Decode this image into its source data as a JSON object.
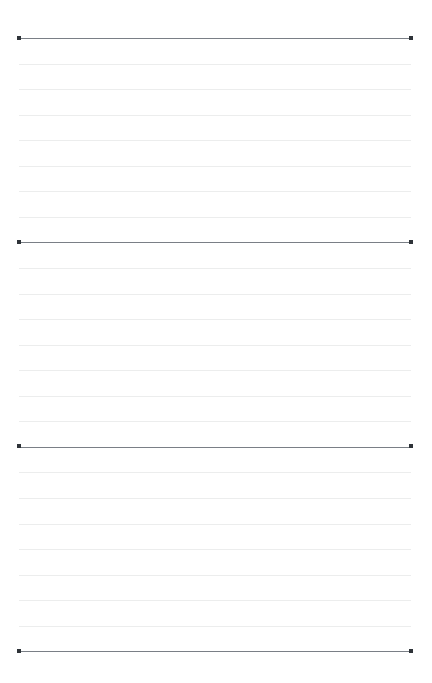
{
  "document": {
    "kind": "ruled-writing-guide-sheet",
    "title": "Lined paper ruling guide",
    "page": {
      "width": 432,
      "height": 683,
      "background_color": "#ffffff"
    },
    "ruling": {
      "left_x": 19,
      "right_x": 411,
      "line_length": 392,
      "first_line_y": 38,
      "last_line_y": 651,
      "line_spacing": 25.55,
      "total_lines": 25,
      "major_line_interval": 8,
      "faint_lines_between_major": 7,
      "major_line_color": "#7a7f86",
      "faint_line_color": "#eceded",
      "line_thickness": 1
    },
    "handles": {
      "shape": "square",
      "size": 4,
      "color": "#2e3338",
      "count": 8,
      "positions": [
        {
          "name": "baseline-1-left",
          "x": 19,
          "y": 38
        },
        {
          "name": "baseline-1-right",
          "x": 411,
          "y": 38
        },
        {
          "name": "baseline-2-left",
          "x": 19,
          "y": 242
        },
        {
          "name": "baseline-2-right",
          "x": 411,
          "y": 242
        },
        {
          "name": "baseline-3-left",
          "x": 19,
          "y": 446
        },
        {
          "name": "baseline-3-right",
          "x": 411,
          "y": 446
        },
        {
          "name": "baseline-4-left",
          "x": 19,
          "y": 651
        },
        {
          "name": "baseline-4-right",
          "x": 411,
          "y": 651
        }
      ]
    },
    "lines": [
      {
        "index": 0,
        "y": 38,
        "type": "major",
        "handles": true
      },
      {
        "index": 1,
        "y": 63.6,
        "type": "faint",
        "handles": false
      },
      {
        "index": 2,
        "y": 89.1,
        "type": "faint",
        "handles": false
      },
      {
        "index": 3,
        "y": 114.7,
        "type": "faint",
        "handles": false
      },
      {
        "index": 4,
        "y": 140.2,
        "type": "faint",
        "handles": false
      },
      {
        "index": 5,
        "y": 165.8,
        "type": "faint",
        "handles": false
      },
      {
        "index": 6,
        "y": 191.3,
        "type": "faint",
        "handles": false
      },
      {
        "index": 7,
        "y": 216.9,
        "type": "faint",
        "handles": false
      },
      {
        "index": 8,
        "y": 242.4,
        "type": "major",
        "handles": true
      },
      {
        "index": 9,
        "y": 268.0,
        "type": "faint",
        "handles": false
      },
      {
        "index": 10,
        "y": 293.5,
        "type": "faint",
        "handles": false
      },
      {
        "index": 11,
        "y": 319.1,
        "type": "faint",
        "handles": false
      },
      {
        "index": 12,
        "y": 344.6,
        "type": "faint",
        "handles": false
      },
      {
        "index": 13,
        "y": 370.2,
        "type": "faint",
        "handles": false
      },
      {
        "index": 14,
        "y": 395.7,
        "type": "faint",
        "handles": false
      },
      {
        "index": 15,
        "y": 421.3,
        "type": "faint",
        "handles": false
      },
      {
        "index": 16,
        "y": 446.8,
        "type": "major",
        "handles": true
      },
      {
        "index": 17,
        "y": 472.4,
        "type": "faint",
        "handles": false
      },
      {
        "index": 18,
        "y": 497.9,
        "type": "faint",
        "handles": false
      },
      {
        "index": 19,
        "y": 523.5,
        "type": "faint",
        "handles": false
      },
      {
        "index": 20,
        "y": 549.0,
        "type": "faint",
        "handles": false
      },
      {
        "index": 21,
        "y": 574.6,
        "type": "faint",
        "handles": false
      },
      {
        "index": 22,
        "y": 600.1,
        "type": "faint",
        "handles": false
      },
      {
        "index": 23,
        "y": 625.7,
        "type": "faint",
        "handles": false
      },
      {
        "index": 24,
        "y": 651.2,
        "type": "major",
        "handles": true
      }
    ]
  }
}
